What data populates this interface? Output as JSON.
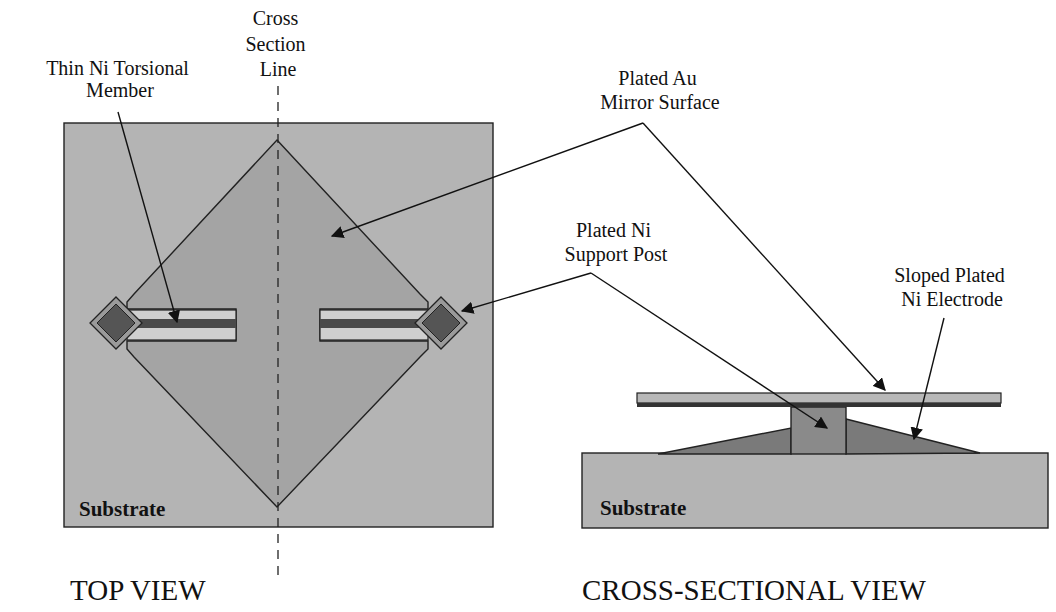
{
  "figure": {
    "top_view": {
      "caption": "TOP VIEW",
      "substrate_label": "Substrate",
      "labels": {
        "torsional_member": [
          "Thin Ni Torsional",
          "Member"
        ],
        "cross_section_line": [
          "Cross",
          "Section",
          "Line"
        ],
        "mirror_surface": [
          "Plated Au",
          "Mirror Surface"
        ],
        "support_post": [
          "Plated Ni",
          "Support Post"
        ]
      }
    },
    "cross_section_view": {
      "caption": "CROSS-SECTIONAL VIEW",
      "substrate_label": "Substrate",
      "labels": {
        "electrode": [
          "Sloped Plated",
          "Ni Electrode"
        ]
      }
    },
    "colors": {
      "substrate": "#b4b4b4",
      "mirror": "#a4a4a4",
      "slot": "#cfcfcf",
      "beam": "#4a4a4a",
      "pad_outer": "#9a9a9a",
      "pad_inner": "#555555",
      "electrode": "#7a7a7a",
      "post": "#8a8a8a",
      "mirror_top": "#b8b8b8",
      "mirror_bottom": "#333333"
    }
  }
}
